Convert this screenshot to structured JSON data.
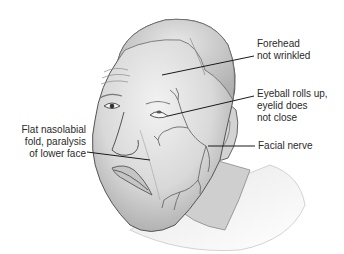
{
  "diagram": {
    "colors": {
      "skin": "#dedede",
      "skin_shadow": "#b5b5b5",
      "outline": "#555555",
      "nerve": "#6a6a6a",
      "leader": "#1a1a1a",
      "text": "#2a2a2a"
    },
    "labels": {
      "forehead": {
        "line1": "Forehead",
        "line2": "not wrinkled"
      },
      "eyeball": {
        "line1": "Eyeball rolls up,",
        "line2": "eyelid does",
        "line3": "not close"
      },
      "facial_nerve": {
        "line1": "Facial nerve"
      },
      "nasolabial": {
        "line1": "Flat nasolabial",
        "line2": "fold, paralysis",
        "line3": "of lower face"
      }
    }
  }
}
